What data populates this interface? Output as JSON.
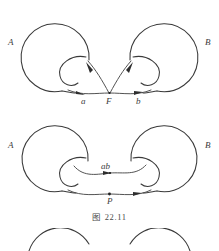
{
  "figure": {
    "caption": "图 22.11",
    "panels": [
      {
        "id": "top",
        "labels": {
          "left_circle": "A",
          "right_circle": "B",
          "left_path": "a",
          "base_point": "F",
          "right_path": "b"
        }
      },
      {
        "id": "middle",
        "labels": {
          "left_circle": "A",
          "right_circle": "B",
          "product_path": "ab",
          "base_point": "P"
        }
      },
      {
        "id": "bottom",
        "labels": {}
      }
    ]
  },
  "style": {
    "stroke_color": "#3a3a3a",
    "label_color": "#3c3c3c",
    "background": "#ffffff",
    "caption_color": "#4a4a4a"
  }
}
